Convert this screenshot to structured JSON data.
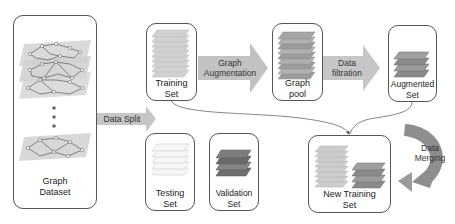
{
  "diagram": {
    "nodes": {
      "graph_dataset": {
        "line1": "Graph",
        "line2": "Dataset"
      },
      "training_set": {
        "line1": "Training",
        "line2": "Set"
      },
      "graph_pool": {
        "line1": "Graph",
        "line2": "pool"
      },
      "augmented_set": {
        "line1": "Augmented",
        "line2": "Set"
      },
      "testing_set": {
        "line1": "Testing",
        "line2": "Set"
      },
      "validation_set": {
        "line1": "Validation",
        "line2": "Set"
      },
      "new_training_set": {
        "line1": "New Training",
        "line2": "Set"
      }
    },
    "arrows": {
      "data_split": {
        "label": "Data Split"
      },
      "graph_augmentation": {
        "line1": "Graph",
        "line2": "Augmentation"
      },
      "data_filtration": {
        "line1": "Data",
        "line2": "filtration"
      },
      "data_merging": {
        "line1": "Data",
        "line2": "Merging"
      }
    },
    "colors": {
      "arrow_fill": "#c8c8c8",
      "layer_light": "#d9d9d9",
      "layer_mid": "#a9a9a9",
      "layer_dark": "#6f6f6f",
      "graph_plane": "#dcdcdc",
      "border": "#555555"
    }
  }
}
